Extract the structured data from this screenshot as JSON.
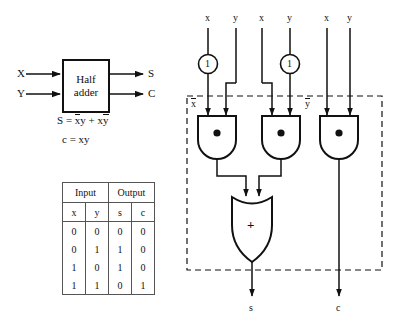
{
  "figure": {
    "stroke_color": "#111111",
    "background": "#ffffff"
  },
  "block_diagram": {
    "box_label_line1": "Half",
    "box_label_line2": "adder",
    "inputs": [
      {
        "label": "X",
        "name": "input-x"
      },
      {
        "label": "Y",
        "name": "input-y"
      }
    ],
    "outputs": [
      {
        "label": "S",
        "name": "output-s"
      },
      {
        "label": "C",
        "name": "output-c"
      }
    ],
    "equations": [
      {
        "lhs": "S",
        "eq": "=",
        "term1_a": "x",
        "term1_b": "y",
        "plus": "+",
        "term2_a": "x",
        "term2_b": "y",
        "text": "S = x̄y + xȳ"
      },
      {
        "lhs": "c",
        "eq": "=",
        "rhs": "xy",
        "text": "c = xy"
      }
    ]
  },
  "truth_table": {
    "group_headers": [
      "Input",
      "Output"
    ],
    "columns": [
      "x",
      "y",
      "s",
      "c"
    ],
    "rows": [
      [
        "0",
        "0",
        "0",
        "0"
      ],
      [
        "0",
        "1",
        "1",
        "0"
      ],
      [
        "1",
        "0",
        "1",
        "0"
      ],
      [
        "1",
        "1",
        "0",
        "1"
      ]
    ]
  },
  "circuit": {
    "top_inputs": [
      {
        "label": "x",
        "name": "circuit-input-x-1"
      },
      {
        "label": "y",
        "name": "circuit-input-y-1"
      },
      {
        "label": "x",
        "name": "circuit-input-x-2"
      },
      {
        "label": "y",
        "name": "circuit-input-y-2"
      },
      {
        "label": "x",
        "name": "circuit-input-x-3"
      },
      {
        "label": "y",
        "name": "circuit-input-y-3"
      }
    ],
    "inverters": [
      {
        "symbol": "1",
        "name": "inverter-x",
        "output_label": "x̄"
      },
      {
        "symbol": "1",
        "name": "inverter-y",
        "output_label": "ȳ"
      }
    ],
    "internal_labels": [
      {
        "label": "x",
        "overbar": true,
        "name": "label-x-bar"
      },
      {
        "label": "y",
        "overbar": true,
        "name": "label-y-bar"
      }
    ],
    "and_gates": [
      {
        "symbol": "●",
        "name": "and-gate-1"
      },
      {
        "symbol": "●",
        "name": "and-gate-2"
      },
      {
        "symbol": "●",
        "name": "and-gate-3"
      }
    ],
    "or_gate": {
      "symbol": "+",
      "name": "or-gate"
    },
    "outputs": [
      {
        "label": "s",
        "name": "circuit-output-s"
      },
      {
        "label": "c",
        "name": "circuit-output-c"
      }
    ],
    "boundary": {
      "style": "dashed",
      "name": "circuit-boundary"
    }
  }
}
